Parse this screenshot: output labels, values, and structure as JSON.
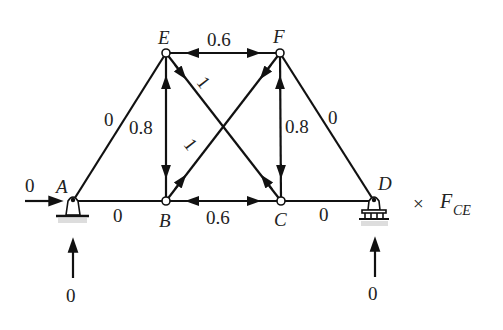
{
  "diagram": {
    "type": "truss",
    "nodes": {
      "A": {
        "label": "A",
        "x": 73,
        "y": 201
      },
      "B": {
        "label": "B",
        "x": 166,
        "y": 201
      },
      "C": {
        "label": "C",
        "x": 281,
        "y": 201
      },
      "D": {
        "label": "D",
        "x": 374,
        "y": 201
      },
      "E": {
        "label": "E",
        "x": 166,
        "y": 53
      },
      "F": {
        "label": "F",
        "x": 280,
        "y": 53
      }
    },
    "members": [
      {
        "id": "AE",
        "force": "0"
      },
      {
        "id": "AB",
        "force": "0"
      },
      {
        "id": "BC",
        "force": "0.6"
      },
      {
        "id": "CD",
        "force": "0"
      },
      {
        "id": "EF",
        "force": "0.6"
      },
      {
        "id": "BE",
        "force": "0.8"
      },
      {
        "id": "CF",
        "force": "0.8"
      },
      {
        "id": "CE",
        "force": "1"
      },
      {
        "id": "BF",
        "force": "1"
      },
      {
        "id": "DF",
        "force": "0"
      }
    ],
    "reactions": {
      "A_horizontal": "0",
      "A_vertical": "0",
      "D_vertical": "0"
    },
    "multiplier": {
      "symbol": "×",
      "text": "F",
      "subscript": "CE"
    }
  }
}
